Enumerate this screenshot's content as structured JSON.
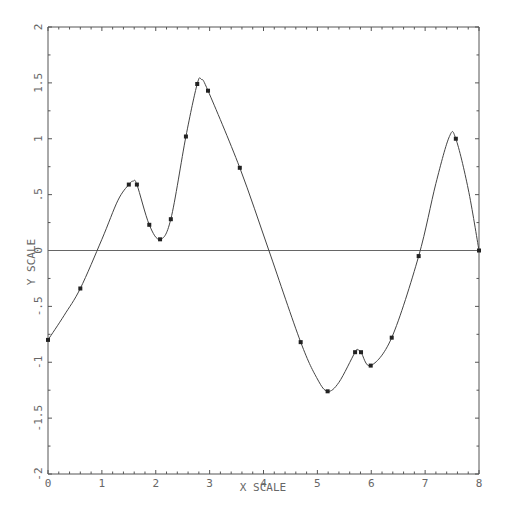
{
  "chart_data": {
    "type": "line",
    "title": "",
    "xlabel": "X SCALE",
    "ylabel": "Y SCALE",
    "xlim": [
      0,
      8
    ],
    "ylim": [
      -2,
      2
    ],
    "grid": false,
    "legend": null,
    "x_ticks": [
      0,
      1,
      2,
      3,
      4,
      5,
      6,
      7,
      8
    ],
    "x_tick_labels": [
      "0",
      "1",
      "2",
      "3",
      "4",
      "5",
      "6",
      "7",
      "8"
    ],
    "x_minor_step": 0.2,
    "y_ticks": [
      -2,
      -1.5,
      -1,
      -0.5,
      0,
      0.5,
      1,
      1.5,
      2
    ],
    "y_tick_labels": [
      "-2",
      "-1.5",
      "-1",
      "-.5",
      "0",
      ".5",
      "1",
      "1.5",
      "2"
    ],
    "y_minor_step": 0.25,
    "reference_line": {
      "y": 0
    },
    "series": [
      {
        "name": "data points",
        "style": "markers",
        "x": [
          0.0,
          0.6,
          1.5,
          1.65,
          1.88,
          2.08,
          2.28,
          2.56,
          2.77,
          2.97,
          3.56,
          4.69,
          5.19,
          5.7,
          5.81,
          5.99,
          6.38,
          6.88,
          7.57,
          8.0
        ],
        "y": [
          -0.8,
          -0.34,
          0.59,
          0.59,
          0.23,
          0.1,
          0.28,
          1.02,
          1.49,
          1.43,
          0.74,
          -0.82,
          -1.26,
          -0.91,
          -0.91,
          -1.03,
          -0.78,
          -0.05,
          1.0,
          0.0
        ]
      },
      {
        "name": "smooth fit",
        "style": "line",
        "x": [
          0.0,
          0.3,
          0.6,
          1.0,
          1.3,
          1.5,
          1.58,
          1.65,
          1.88,
          2.08,
          2.28,
          2.56,
          2.77,
          2.85,
          2.97,
          3.56,
          4.1,
          4.69,
          5.0,
          5.19,
          5.4,
          5.7,
          5.75,
          5.81,
          5.99,
          6.38,
          6.88,
          7.2,
          7.45,
          7.57,
          7.8,
          8.0
        ],
        "y": [
          -0.8,
          -0.58,
          -0.34,
          0.1,
          0.45,
          0.59,
          0.62,
          0.59,
          0.23,
          0.1,
          0.28,
          1.02,
          1.49,
          1.53,
          1.43,
          0.74,
          0.0,
          -0.82,
          -1.15,
          -1.26,
          -1.18,
          -0.91,
          -0.89,
          -0.91,
          -1.03,
          -0.78,
          -0.05,
          0.6,
          1.02,
          1.0,
          0.55,
          0.0
        ]
      }
    ]
  }
}
